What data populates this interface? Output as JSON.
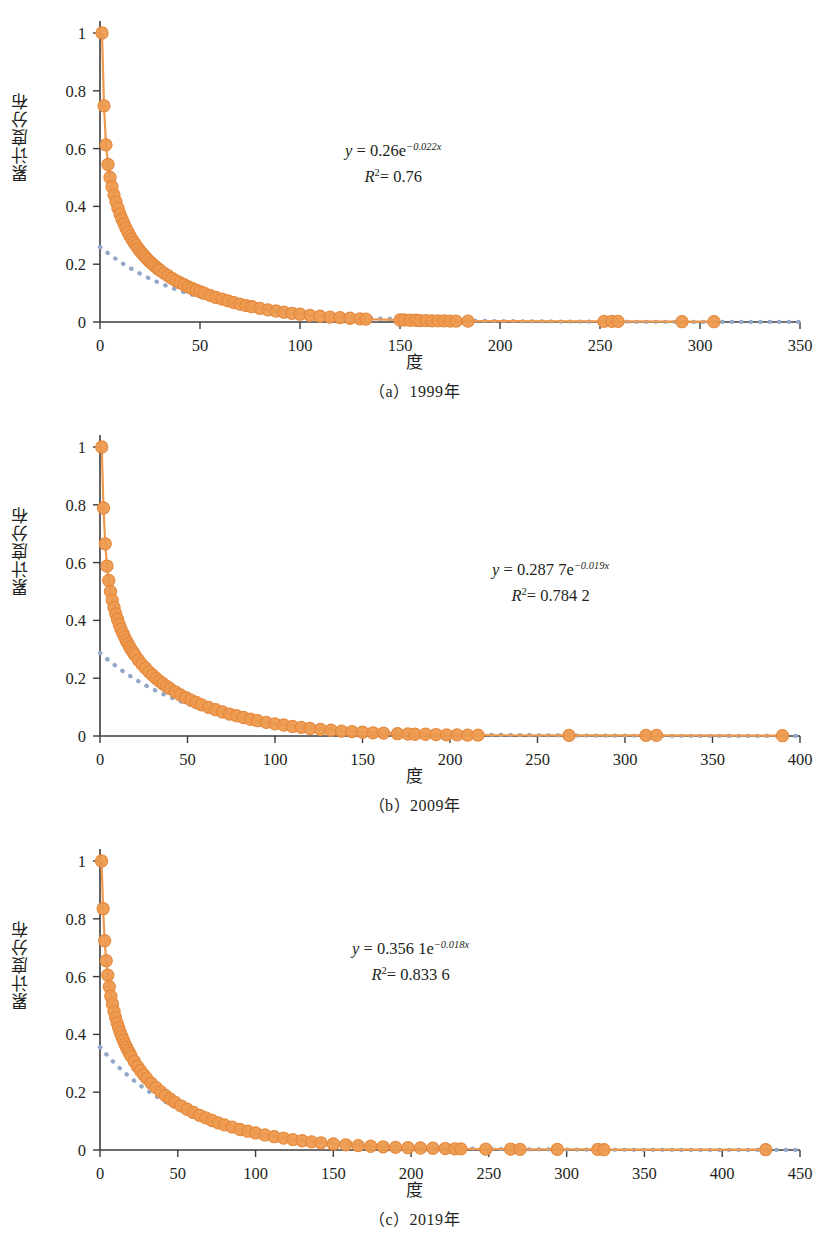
{
  "figure": {
    "axis_color": "#3b3b3b",
    "marker_color": "#ED9A4F",
    "marker_edge_color": "#E5883C",
    "trend_color": "#92A8C9",
    "text_color": "#231f20",
    "background": "#ffffff"
  },
  "panels": [
    {
      "id": "a",
      "caption": "（a）1999年",
      "xlabel": "度",
      "ylabel": "累计度分布",
      "equation": {
        "y_prefix": "y",
        "eq": " = 0.26e",
        "exponent": "−0.022x",
        "r2_label": "R",
        "r2_sup": "2",
        "r2_value": "= 0.76"
      },
      "chart_data": {
        "type": "scatter",
        "title": "（a）1999年",
        "xlabel": "度",
        "ylabel": "累计度分布",
        "xlim": [
          0,
          350
        ],
        "ylim": [
          0,
          1
        ],
        "xticks": [
          0,
          50,
          100,
          150,
          200,
          250,
          300,
          350
        ],
        "yticks": [
          0,
          0.2,
          0.4,
          0.6,
          0.8,
          1
        ],
        "grid": false,
        "legend": "none",
        "fit": {
          "a": 0.26,
          "b": -0.022,
          "r2": 0.76,
          "style": "dotted"
        },
        "series": [
          {
            "name": "累计度分布",
            "x": [
              1,
              2,
              3,
              4,
              5,
              6,
              7,
              8,
              9,
              10,
              11,
              12,
              13,
              14,
              15,
              16,
              17,
              18,
              19,
              20,
              21,
              22,
              23,
              24,
              25,
              26,
              27,
              28,
              29,
              30,
              32,
              34,
              36,
              38,
              40,
              42,
              44,
              46,
              48,
              50,
              52,
              55,
              58,
              61,
              64,
              67,
              70,
              73,
              76,
              80,
              84,
              88,
              92,
              96,
              100,
              105,
              110,
              115,
              120,
              125,
              130,
              133,
              150,
              152,
              155,
              158,
              160,
              163,
              166,
              169,
              172,
              175,
              178,
              184,
              252,
              256,
              259,
              291,
              307
            ],
            "y": [
              1.0,
              0.748,
              0.613,
              0.545,
              0.5,
              0.468,
              0.44,
              0.416,
              0.394,
              0.374,
              0.356,
              0.34,
              0.325,
              0.311,
              0.298,
              0.286,
              0.275,
              0.265,
              0.255,
              0.246,
              0.238,
              0.23,
              0.222,
              0.215,
              0.208,
              0.202,
              0.196,
              0.19,
              0.184,
              0.179,
              0.169,
              0.16,
              0.151,
              0.143,
              0.136,
              0.129,
              0.122,
              0.116,
              0.11,
              0.105,
              0.1,
              0.092,
              0.085,
              0.079,
              0.073,
              0.067,
              0.062,
              0.057,
              0.053,
              0.047,
              0.042,
              0.038,
              0.034,
              0.03,
              0.027,
              0.023,
              0.02,
              0.017,
              0.015,
              0.013,
              0.011,
              0.01,
              0.007,
              0.007,
              0.006,
              0.006,
              0.005,
              0.005,
              0.004,
              0.004,
              0.004,
              0.003,
              0.003,
              0.003,
              0.002,
              0.002,
              0.002,
              0.001,
              0.001
            ]
          }
        ]
      }
    },
    {
      "id": "b",
      "caption": "（b）2009年",
      "xlabel": "度",
      "ylabel": "累计度分布",
      "equation": {
        "y_prefix": "y",
        "eq": " = 0.287 7e",
        "exponent": "−0.019x",
        "r2_label": "R",
        "r2_sup": "2",
        "r2_value": "= 0.784 2"
      },
      "chart_data": {
        "type": "scatter",
        "title": "（b）2009年",
        "xlabel": "度",
        "ylabel": "累计度分布",
        "xlim": [
          0,
          400
        ],
        "ylim": [
          0,
          1
        ],
        "xticks": [
          0,
          50,
          100,
          150,
          200,
          250,
          300,
          350,
          400
        ],
        "yticks": [
          0,
          0.2,
          0.4,
          0.6,
          0.8,
          1
        ],
        "grid": false,
        "legend": "none",
        "fit": {
          "a": 0.2877,
          "b": -0.019,
          "r2": 0.7842,
          "style": "dotted"
        },
        "series": [
          {
            "name": "累计度分布",
            "x": [
              1,
              2,
              3,
              4,
              5,
              6,
              7,
              8,
              9,
              10,
              11,
              12,
              13,
              14,
              15,
              16,
              17,
              18,
              19,
              20,
              22,
              24,
              26,
              28,
              30,
              32,
              34,
              36,
              38,
              40,
              43,
              46,
              49,
              52,
              55,
              58,
              62,
              66,
              70,
              74,
              78,
              82,
              86,
              90,
              95,
              100,
              105,
              110,
              115,
              120,
              126,
              132,
              138,
              144,
              150,
              156,
              162,
              170,
              176,
              180,
              186,
              192,
              198,
              204,
              210,
              216,
              268,
              312,
              318,
              390
            ],
            "y": [
              1.0,
              0.789,
              0.665,
              0.588,
              0.538,
              0.5,
              0.47,
              0.445,
              0.423,
              0.404,
              0.386,
              0.37,
              0.356,
              0.343,
              0.33,
              0.319,
              0.308,
              0.298,
              0.289,
              0.28,
              0.263,
              0.248,
              0.235,
              0.222,
              0.211,
              0.2,
              0.19,
              0.181,
              0.172,
              0.164,
              0.153,
              0.142,
              0.133,
              0.124,
              0.116,
              0.108,
              0.099,
              0.091,
              0.083,
              0.076,
              0.07,
              0.064,
              0.058,
              0.053,
              0.047,
              0.042,
              0.038,
              0.033,
              0.03,
              0.026,
              0.023,
              0.02,
              0.017,
              0.015,
              0.013,
              0.011,
              0.01,
              0.008,
              0.007,
              0.006,
              0.006,
              0.005,
              0.004,
              0.004,
              0.003,
              0.003,
              0.002,
              0.002,
              0.002,
              0.001
            ]
          }
        ]
      }
    },
    {
      "id": "c",
      "caption": "（c）2019年",
      "xlabel": "度",
      "ylabel": "累计度分布",
      "equation": {
        "y_prefix": "y",
        "eq": " = 0.356 1e",
        "exponent": "−0.018x",
        "r2_label": "R",
        "r2_sup": "2",
        "r2_value": "= 0.833 6"
      },
      "chart_data": {
        "type": "scatter",
        "title": "（c）2019年",
        "xlabel": "度",
        "ylabel": "累计度分布",
        "xlim": [
          0,
          450
        ],
        "ylim": [
          0,
          1
        ],
        "xticks": [
          0,
          50,
          100,
          150,
          200,
          250,
          300,
          350,
          400,
          450
        ],
        "yticks": [
          0,
          0.2,
          0.4,
          0.6,
          0.8,
          1
        ],
        "grid": false,
        "legend": "none",
        "fit": {
          "a": 0.3561,
          "b": -0.018,
          "r2": 0.8336,
          "style": "dotted"
        },
        "series": [
          {
            "name": "累计度分布",
            "x": [
              1,
              2,
              3,
              4,
              5,
              6,
              7,
              8,
              9,
              10,
              11,
              12,
              13,
              14,
              15,
              16,
              17,
              18,
              19,
              20,
              22,
              24,
              26,
              28,
              30,
              33,
              36,
              39,
              42,
              45,
              48,
              52,
              56,
              60,
              64,
              68,
              72,
              76,
              80,
              85,
              90,
              95,
              100,
              106,
              112,
              118,
              124,
              130,
              136,
              142,
              150,
              158,
              166,
              174,
              182,
              190,
              198,
              206,
              214,
              222,
              228,
              232,
              248,
              264,
              270,
              294,
              320,
              324,
              428
            ],
            "y": [
              1.0,
              0.835,
              0.724,
              0.655,
              0.605,
              0.565,
              0.532,
              0.505,
              0.48,
              0.459,
              0.44,
              0.423,
              0.407,
              0.393,
              0.38,
              0.367,
              0.356,
              0.345,
              0.335,
              0.325,
              0.307,
              0.29,
              0.275,
              0.261,
              0.248,
              0.231,
              0.216,
              0.202,
              0.189,
              0.177,
              0.166,
              0.153,
              0.141,
              0.13,
              0.12,
              0.111,
              0.102,
              0.094,
              0.087,
              0.079,
              0.071,
              0.065,
              0.059,
              0.052,
              0.046,
              0.041,
              0.036,
              0.032,
              0.028,
              0.025,
              0.021,
              0.018,
              0.015,
              0.013,
              0.011,
              0.009,
              0.008,
              0.007,
              0.006,
              0.005,
              0.004,
              0.004,
              0.003,
              0.003,
              0.002,
              0.002,
              0.002,
              0.001,
              0.001
            ]
          }
        ]
      }
    }
  ]
}
